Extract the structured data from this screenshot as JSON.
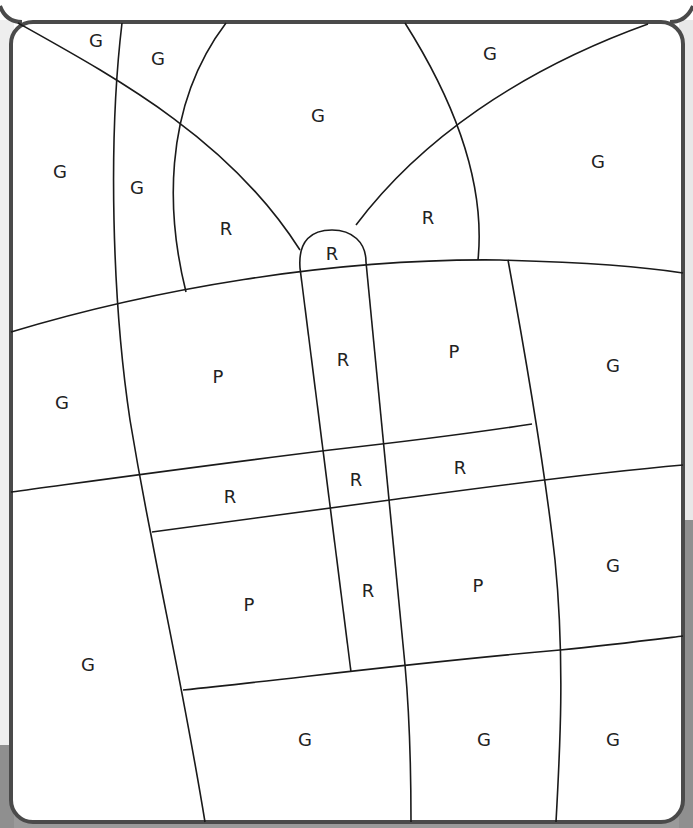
{
  "worksheet": {
    "type": "color-by-letter",
    "border_color": "#4a4a4a",
    "line_color": "#1a1a1a"
  },
  "regions": [
    {
      "letter": "G",
      "x": 96,
      "y": 42
    },
    {
      "letter": "G",
      "x": 158,
      "y": 60
    },
    {
      "letter": "G",
      "x": 490,
      "y": 55
    },
    {
      "letter": "G",
      "x": 318,
      "y": 117
    },
    {
      "letter": "G",
      "x": 60,
      "y": 173
    },
    {
      "letter": "G",
      "x": 137,
      "y": 189
    },
    {
      "letter": "G",
      "x": 598,
      "y": 163
    },
    {
      "letter": "R",
      "x": 226,
      "y": 230
    },
    {
      "letter": "R",
      "x": 428,
      "y": 219
    },
    {
      "letter": "R",
      "x": 332,
      "y": 255
    },
    {
      "letter": "P",
      "x": 218,
      "y": 378
    },
    {
      "letter": "R",
      "x": 343,
      "y": 361
    },
    {
      "letter": "P",
      "x": 454,
      "y": 353
    },
    {
      "letter": "G",
      "x": 613,
      "y": 367
    },
    {
      "letter": "G",
      "x": 62,
      "y": 404
    },
    {
      "letter": "R",
      "x": 230,
      "y": 498
    },
    {
      "letter": "R",
      "x": 356,
      "y": 481
    },
    {
      "letter": "R",
      "x": 460,
      "y": 469
    },
    {
      "letter": "P",
      "x": 249,
      "y": 606
    },
    {
      "letter": "R",
      "x": 368,
      "y": 592
    },
    {
      "letter": "P",
      "x": 478,
      "y": 587
    },
    {
      "letter": "G",
      "x": 613,
      "y": 567
    },
    {
      "letter": "G",
      "x": 88,
      "y": 666
    },
    {
      "letter": "G",
      "x": 305,
      "y": 741
    },
    {
      "letter": "G",
      "x": 484,
      "y": 741
    },
    {
      "letter": "G",
      "x": 613,
      "y": 741
    }
  ]
}
